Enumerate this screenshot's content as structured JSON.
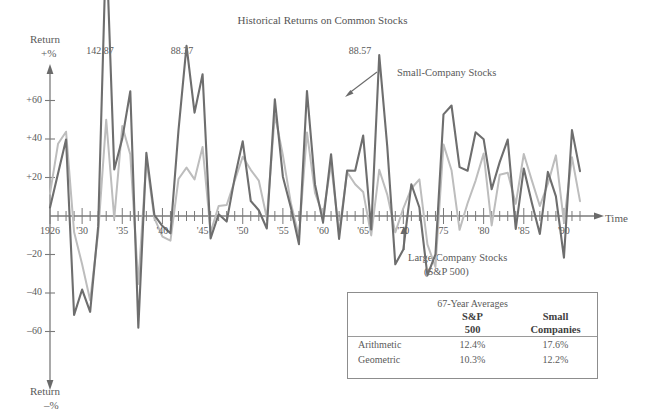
{
  "chart_data": {
    "type": "line",
    "title": "Historical Returns on Common Stocks",
    "xlabel": "Time",
    "ylabel_top_line1": "Return",
    "ylabel_top_line2": "+%",
    "ylabel_bottom_line1": "Return",
    "ylabel_bottom_line2": "–%",
    "ylim": [
      -70,
      100
    ],
    "yticks": [
      60,
      40,
      20,
      -20,
      -40,
      -60
    ],
    "ytick_labels": [
      "+60",
      "+40",
      "+20",
      "–20",
      "–40",
      "–60"
    ],
    "xlim": [
      1926,
      1992
    ],
    "xticks": [
      1926,
      1930,
      1935,
      1940,
      1945,
      1950,
      1955,
      1960,
      1965,
      1970,
      1975,
      1980,
      1985,
      1990
    ],
    "xtick_labels": [
      "1926",
      "'30",
      "'35",
      "'40",
      "'45",
      "'50",
      "'55",
      "'60",
      "'65",
      "'70",
      "75",
      "'80",
      "'85",
      "'90"
    ],
    "minor_tick_every": 1,
    "grid": false,
    "legend_position": "inline-annotation",
    "x": [
      1926,
      1927,
      1928,
      1929,
      1930,
      1931,
      1932,
      1933,
      1934,
      1935,
      1936,
      1937,
      1938,
      1939,
      1940,
      1941,
      1942,
      1943,
      1944,
      1945,
      1946,
      1947,
      1948,
      1949,
      1950,
      1951,
      1952,
      1953,
      1954,
      1955,
      1956,
      1957,
      1958,
      1959,
      1960,
      1961,
      1962,
      1963,
      1964,
      1965,
      1966,
      1967,
      1968,
      1969,
      1970,
      1971,
      1972,
      1973,
      1974,
      1975,
      1976,
      1977,
      1978,
      1979,
      1980,
      1981,
      1982,
      1983,
      1984,
      1985,
      1986,
      1987,
      1988,
      1989,
      1990,
      1991,
      1992
    ],
    "series": [
      {
        "name": "Small-Company Stocks",
        "color": "#6e6e6e",
        "values": [
          4.4,
          22.1,
          39.7,
          -51.4,
          -38.2,
          -49.8,
          -5.4,
          142.87,
          24.2,
          40.2,
          64.8,
          -58.0,
          32.8,
          0.4,
          -5.2,
          -9.0,
          44.5,
          88.37,
          53.7,
          73.6,
          -11.6,
          0.9,
          -2.9,
          19.8,
          38.8,
          7.8,
          3.0,
          -6.5,
          60.6,
          20.4,
          4.3,
          -14.6,
          64.9,
          16.4,
          -3.3,
          32.1,
          -11.9,
          23.6,
          23.5,
          41.8,
          -7.0,
          83.6,
          36.0,
          -25.1,
          -17.4,
          16.5,
          4.4,
          -30.9,
          -19.9,
          52.8,
          57.4,
          25.4,
          23.5,
          43.5,
          39.9,
          13.9,
          28.0,
          39.7,
          -6.7,
          24.7,
          6.9,
          -9.3,
          22.9,
          10.2,
          -21.6,
          44.6,
          23.3
        ]
      },
      {
        "name": "Large-Company Stocks (S&P 500)",
        "color": "#bdbdbd",
        "values": [
          11.6,
          37.5,
          43.8,
          -8.3,
          -25.1,
          -43.8,
          -8.6,
          50.0,
          -1.2,
          46.7,
          31.9,
          -35.3,
          29.3,
          -1.1,
          -10.7,
          -12.8,
          19.2,
          25.1,
          19.0,
          35.8,
          -8.4,
          5.2,
          5.7,
          18.3,
          30.8,
          24.0,
          18.4,
          -1.0,
          52.6,
          31.6,
          6.6,
          -10.8,
          43.4,
          12.0,
          0.5,
          26.9,
          -8.7,
          22.8,
          16.5,
          12.5,
          -10.1,
          24.0,
          11.1,
          -8.5,
          4.0,
          14.3,
          19.0,
          -14.7,
          -26.5,
          37.2,
          23.8,
          -7.2,
          6.6,
          18.4,
          32.4,
          -4.9,
          21.4,
          22.5,
          6.3,
          32.2,
          18.5,
          5.2,
          16.8,
          31.5,
          -3.2,
          30.5,
          7.7
        ]
      }
    ],
    "annotations": [
      {
        "name": "peak-1933",
        "text": "142.87",
        "year": 1933,
        "value": 142.87
      },
      {
        "name": "peak-1943",
        "text": "88.37",
        "year": 1943,
        "value": 88.37
      },
      {
        "name": "peak-1967",
        "text": "88.57",
        "year": 1967,
        "value": 83.6
      },
      {
        "name": "callout-small",
        "text": "Small-Company Stocks"
      },
      {
        "name": "callout-large-line1",
        "text": "Large-Company Stocks"
      },
      {
        "name": "callout-large-line2",
        "text": "(S&P 500)"
      }
    ]
  },
  "legend_table": {
    "caption": "67-Year Averages",
    "columns": [
      {
        "line1": "",
        "line2": ""
      },
      {
        "line1": "S&P",
        "line2": "500"
      },
      {
        "line1": "Small",
        "line2": "Companies"
      }
    ],
    "rows": [
      {
        "label": "Arithmetic",
        "sp500": "12.4%",
        "small": "17.6%"
      },
      {
        "label": "Geometric",
        "sp500": "10.3%",
        "small": "12.2%"
      }
    ]
  }
}
